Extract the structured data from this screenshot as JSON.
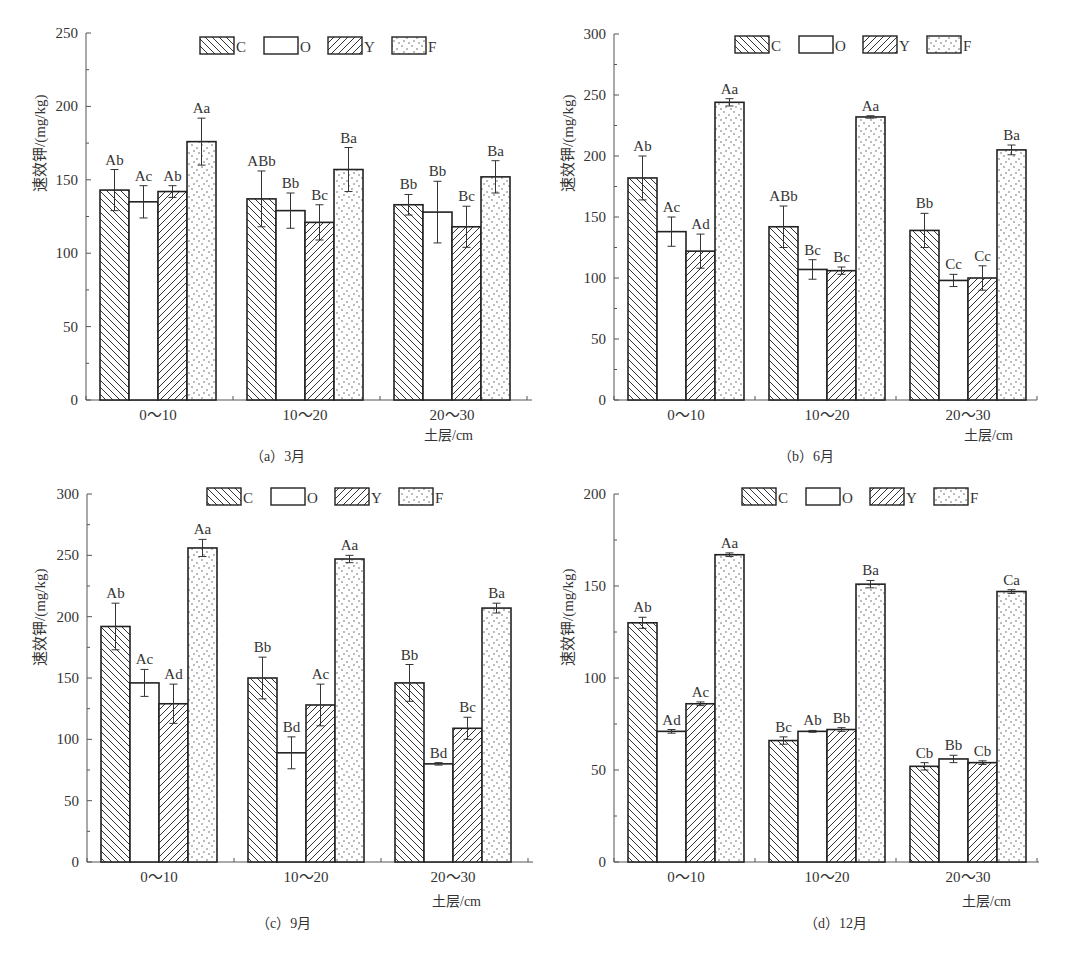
{
  "figure": {
    "series_names": [
      "C",
      "O",
      "Y",
      "F"
    ],
    "series_patterns": {
      "C": "backslash-hatch",
      "O": "empty",
      "Y": "slash-hatch",
      "F": "dots"
    },
    "y_axis_label": "速效钾/(mg/kg)",
    "x_axis_unit": "土层/cm",
    "categories": [
      "0～10",
      "10～20",
      "20～30"
    ],
    "colors": {
      "stroke": "#222222",
      "fill": "#ffffff",
      "text": "#333333"
    }
  },
  "panels": [
    {
      "id": "a",
      "caption": "（a）3月"
    },
    {
      "id": "b",
      "caption": "（b）6月"
    },
    {
      "id": "c",
      "caption": "（c）9月"
    },
    {
      "id": "d",
      "caption": "（d）12月"
    }
  ],
  "chart_data": [
    {
      "type": "bar",
      "title": "（a）3月",
      "xlabel": "土层/cm",
      "ylabel": "速效钾/(mg/kg)",
      "categories": [
        "0～10",
        "10～20",
        "20～30"
      ],
      "ylim": [
        0,
        250
      ],
      "yticks": [
        0,
        50,
        100,
        150,
        200,
        250
      ],
      "legend": {
        "position": "top",
        "entries": [
          "C",
          "O",
          "Y",
          "F"
        ]
      },
      "grid": false,
      "series": [
        {
          "name": "C",
          "values": [
            143,
            137,
            133
          ],
          "errors": [
            14,
            19,
            7
          ],
          "labels": [
            "Ab",
            "ABb",
            "Bb"
          ]
        },
        {
          "name": "O",
          "values": [
            135,
            129,
            128
          ],
          "errors": [
            11,
            12,
            21
          ],
          "labels": [
            "Ac",
            "Bb",
            "Bb"
          ]
        },
        {
          "name": "Y",
          "values": [
            142,
            121,
            118
          ],
          "errors": [
            4,
            12,
            14
          ],
          "labels": [
            "Ab",
            "Bc",
            "Bc"
          ]
        },
        {
          "name": "F",
          "values": [
            176,
            157,
            152
          ],
          "errors": [
            16,
            15,
            11
          ],
          "labels": [
            "Aa",
            "Ba",
            "Ba"
          ]
        }
      ]
    },
    {
      "type": "bar",
      "title": "（b）6月",
      "xlabel": "土层/cm",
      "ylabel": "速效钾/(mg/kg)",
      "categories": [
        "0～10",
        "10～20",
        "20～30"
      ],
      "ylim": [
        0,
        300
      ],
      "yticks": [
        0,
        50,
        100,
        150,
        200,
        250,
        300
      ],
      "legend": {
        "position": "top",
        "entries": [
          "C",
          "O",
          "Y",
          "F"
        ]
      },
      "grid": false,
      "series": [
        {
          "name": "C",
          "values": [
            182,
            142,
            139
          ],
          "errors": [
            18,
            17,
            14
          ],
          "labels": [
            "Ab",
            "ABb",
            "Bb"
          ]
        },
        {
          "name": "O",
          "values": [
            138,
            107,
            98
          ],
          "errors": [
            12,
            8,
            5
          ],
          "labels": [
            "Ac",
            "Bc",
            "Cc"
          ]
        },
        {
          "name": "Y",
          "values": [
            122,
            106,
            100
          ],
          "errors": [
            14,
            3,
            10
          ],
          "labels": [
            "Ad",
            "Bc",
            "Cc"
          ]
        },
        {
          "name": "F",
          "values": [
            244,
            232,
            205
          ],
          "errors": [
            3,
            1,
            4
          ],
          "labels": [
            "Aa",
            "Aa",
            "Ba"
          ]
        }
      ]
    },
    {
      "type": "bar",
      "title": "（c）9月",
      "xlabel": "土层/cm",
      "ylabel": "速效钾/(mg/kg)",
      "categories": [
        "0～10",
        "10～20",
        "20～30"
      ],
      "ylim": [
        0,
        300
      ],
      "yticks": [
        0,
        50,
        100,
        150,
        200,
        250,
        300
      ],
      "legend": {
        "position": "top",
        "entries": [
          "C",
          "O",
          "Y",
          "F"
        ]
      },
      "grid": false,
      "series": [
        {
          "name": "C",
          "values": [
            192,
            150,
            146
          ],
          "errors": [
            19,
            17,
            15
          ],
          "labels": [
            "Ab",
            "Bb",
            "Bb"
          ]
        },
        {
          "name": "O",
          "values": [
            146,
            89,
            80
          ],
          "errors": [
            11,
            13,
            1
          ],
          "labels": [
            "Ac",
            "Bd",
            "Bd"
          ]
        },
        {
          "name": "Y",
          "values": [
            129,
            128,
            109
          ],
          "errors": [
            16,
            17,
            9
          ],
          "labels": [
            "Ad",
            "Ac",
            "Bc"
          ]
        },
        {
          "name": "F",
          "values": [
            256,
            247,
            207
          ],
          "errors": [
            7,
            3,
            4
          ],
          "labels": [
            "Aa",
            "Aa",
            "Ba"
          ]
        }
      ]
    },
    {
      "type": "bar",
      "title": "（d）12月",
      "xlabel": "土层/cm",
      "ylabel": "速效钾/(mg/kg)",
      "categories": [
        "0～10",
        "10～20",
        "20～30"
      ],
      "ylim": [
        0,
        200
      ],
      "yticks": [
        0,
        50,
        100,
        150,
        200
      ],
      "legend": {
        "position": "top",
        "entries": [
          "C",
          "O",
          "Y",
          "F"
        ]
      },
      "grid": false,
      "series": [
        {
          "name": "C",
          "values": [
            130,
            66,
            52
          ],
          "errors": [
            3,
            2,
            2
          ],
          "labels": [
            "Ab",
            "Bc",
            "Cb"
          ]
        },
        {
          "name": "O",
          "values": [
            71,
            71,
            56
          ],
          "errors": [
            1,
            0.5,
            2
          ],
          "labels": [
            "Ad",
            "Ab",
            "Bb"
          ]
        },
        {
          "name": "Y",
          "values": [
            86,
            72,
            54
          ],
          "errors": [
            1,
            1,
            1
          ],
          "labels": [
            "Ac",
            "Bb",
            "Cb"
          ]
        },
        {
          "name": "F",
          "values": [
            167,
            151,
            147
          ],
          "errors": [
            1,
            2,
            1
          ],
          "labels": [
            "Aa",
            "Ba",
            "Ca"
          ]
        }
      ]
    }
  ]
}
